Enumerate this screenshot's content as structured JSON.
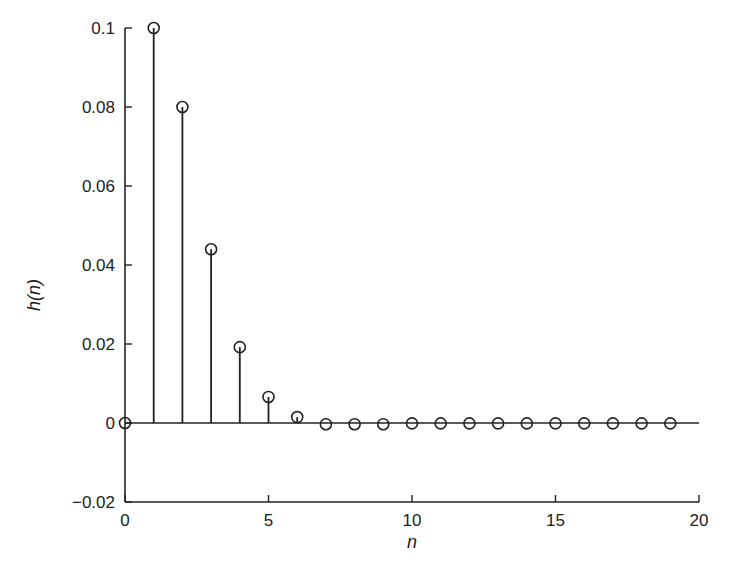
{
  "chart_data": {
    "type": "stem",
    "title": "",
    "xlabel": "n",
    "ylabel": "h(n)",
    "xlim": [
      0,
      20
    ],
    "ylim": [
      -0.02,
      0.1
    ],
    "grid": false,
    "legend": null,
    "x_ticks": [
      0,
      5,
      10,
      15,
      20
    ],
    "x_tick_labels": [
      "0",
      "5",
      "10",
      "15",
      "20"
    ],
    "y_ticks": [
      -0.02,
      0,
      0.02,
      0.04,
      0.06,
      0.08,
      0.1
    ],
    "y_tick_labels": [
      "−0.02",
      "0",
      "0.02",
      "0.04",
      "0.06",
      "0.08",
      "0.1"
    ],
    "x": [
      0,
      1,
      2,
      3,
      4,
      5,
      6,
      7,
      8,
      9,
      10,
      11,
      12,
      13,
      14,
      15,
      16,
      17,
      18,
      19
    ],
    "values": [
      0,
      0.1,
      0.08,
      0.044,
      0.0192,
      0.0066,
      0.0015,
      -0.0003,
      -0.0003,
      -0.0003,
      -0.0001,
      -0.0001,
      -0.0001,
      -0.0001,
      -0.0001,
      -0.0001,
      -0.0001,
      -0.0001,
      -0.0001,
      -0.0001
    ],
    "marker": "circle-open",
    "color": "#222222"
  }
}
